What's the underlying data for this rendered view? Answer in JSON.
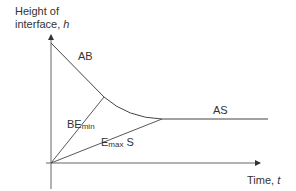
{
  "diagram": {
    "y_axis": {
      "label_line1": "Height of",
      "label_line2_prefix": "interface, ",
      "label_var": "h"
    },
    "x_axis": {
      "label_prefix": "Time, ",
      "label_var": "t"
    },
    "labels": {
      "ab": "AB",
      "be_main": "BE",
      "be_sub": "min",
      "emax_main": "E",
      "emax_sub": "max",
      "emax_suffix": " S",
      "as": "AS"
    },
    "colors": {
      "axis": "#555555",
      "line": "#444444",
      "text": "#333333"
    }
  }
}
